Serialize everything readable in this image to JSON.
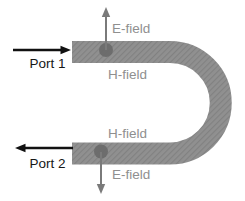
{
  "diagram": {
    "labels": {
      "port1": "Port 1",
      "port2": "Port 2",
      "efield_top": "E-field",
      "efield_bottom": "E-field",
      "hfield_top": "H-field",
      "hfield_bottom": "H-field"
    },
    "icons": {
      "port1_arrow": "right-arrow",
      "port2_arrow": "left-arrow",
      "efield_top_arrow": "up-arrow",
      "efield_bottom_arrow": "down-arrow",
      "efield_top_probe": "dot",
      "efield_bottom_probe": "dot"
    },
    "colors": {
      "background": "#ffffff",
      "tube": "#909090",
      "tube_hatch": "#818181",
      "probe_dot": "#6a6a6a",
      "field_arrow": "#7a7a7a",
      "field_label": "#8f8f8f",
      "port_arrow": "#111111",
      "port_label": "#161616"
    }
  }
}
